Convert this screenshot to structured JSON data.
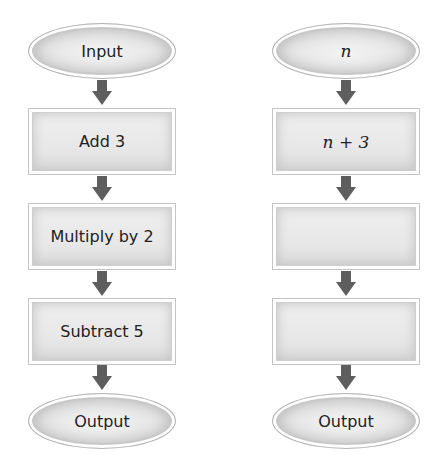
{
  "left_flowchart": {
    "start": "Input",
    "steps": [
      "Add 3",
      "Multiply by 2",
      "Subtract 5"
    ],
    "end": "Output"
  },
  "right_flowchart": {
    "start": "n",
    "steps": [
      "n + 3",
      "",
      ""
    ],
    "end": "Output"
  },
  "colors": {
    "arrow": "#5e5e5e",
    "shape_fill": "#e8e8e8",
    "shape_border": "#c4c4c4",
    "background": "#ffffff"
  }
}
